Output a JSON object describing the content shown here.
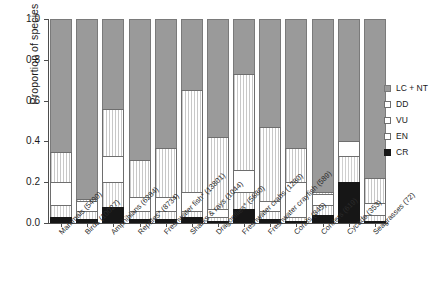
{
  "chart_data": {
    "type": "bar",
    "title": "",
    "subtitle": "",
    "xlabel": "",
    "ylabel": "Proportion of species",
    "ylim": [
      0.0,
      1.0
    ],
    "ytick_labels": [
      "0.0",
      "0.2",
      "0.4",
      "0.6",
      "0.8",
      "1.0"
    ],
    "ytick_values": [
      0.0,
      0.2,
      0.4,
      0.6,
      0.8,
      1.0
    ],
    "grid": false,
    "stacked": true,
    "legend_position": "right",
    "categories": [
      "Mammals (5490)",
      "Birds (10027)",
      "Amphibians (6284)",
      "Reptiles* (8734)",
      "Freshwater fish* (13801)",
      "Sharks & rays (1044)",
      "Dragonflies* (5680)",
      "Freshwater crabs (1280)",
      "Freshwater crayfish (589)",
      "Corals (845)",
      "Conifers (619)",
      "Cycads (353)",
      "Seagrasses (72)"
    ],
    "series": [
      {
        "name": "CR",
        "color": "#161616",
        "values": [
          0.03,
          0.02,
          0.08,
          0.02,
          0.02,
          0.03,
          0.01,
          0.07,
          0.02,
          0.01,
          0.04,
          0.2,
          0.01
        ]
      },
      {
        "name": "EN",
        "color": "#ffffff",
        "values": [
          0.06,
          0.04,
          0.12,
          0.04,
          0.04,
          0.03,
          0.02,
          0.08,
          0.04,
          0.02,
          0.05,
          0.13,
          0.03
        ]
      },
      {
        "name": "VU",
        "color": "#ffffff",
        "values": [
          0.11,
          0.05,
          0.13,
          0.07,
          0.07,
          0.09,
          0.04,
          0.11,
          0.05,
          0.17,
          0.05,
          0.07,
          0.06
        ]
      },
      {
        "name": "DD",
        "color": "#ffffff",
        "values": [
          0.15,
          0.01,
          0.23,
          0.18,
          0.24,
          0.5,
          0.35,
          0.47,
          0.36,
          0.17,
          0.01,
          0.0,
          0.12
        ]
      },
      {
        "name": "LC + NT",
        "color": "#9a9a9a",
        "values": [
          0.65,
          0.88,
          0.44,
          0.69,
          0.63,
          0.35,
          0.58,
          0.27,
          0.53,
          0.63,
          0.85,
          0.6,
          0.78
        ]
      }
    ]
  },
  "legend": {
    "entries": [
      {
        "label": "LC + NT",
        "key": "lcnt"
      },
      {
        "label": "DD",
        "key": "dd"
      },
      {
        "label": "VU",
        "key": "vu"
      },
      {
        "label": "EN",
        "key": "en"
      },
      {
        "label": "CR",
        "key": "cr"
      }
    ]
  },
  "axis": {
    "y_title": "Proportion of species"
  }
}
